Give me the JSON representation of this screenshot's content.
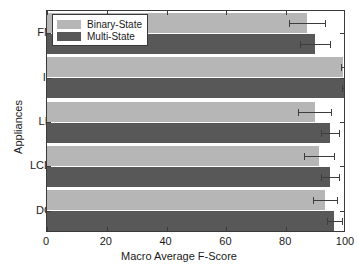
{
  "chart_data": {
    "type": "bar",
    "orientation": "horizontal",
    "title": "",
    "xlabel": "Macro Average F-Score",
    "ylabel": "Appliances",
    "categories": [
      "FN",
      "IL",
      "LP",
      "LCD",
      "DC"
    ],
    "xlim": [
      0,
      100
    ],
    "xticks": [
      0,
      20,
      40,
      60,
      80,
      100
    ],
    "xtick_labels": [
      "0",
      "20",
      "40",
      "60",
      "80",
      "100"
    ],
    "grid": false,
    "legend_position": "upper left",
    "series": [
      {
        "name": "Binary-State",
        "color": "#b6b6b6",
        "values": [
          87.0,
          99.0,
          89.5,
          91.0,
          93.0
        ],
        "errors": [
          6.0,
          0.6,
          5.5,
          5.0,
          4.0
        ]
      },
      {
        "name": "Multi-State",
        "color": "#585858",
        "values": [
          89.5,
          99.2,
          94.5,
          94.5,
          96.0
        ],
        "errors": [
          5.0,
          0.5,
          3.0,
          3.0,
          2.5
        ]
      }
    ]
  },
  "colors": {
    "binary_state": "#b6b6b6",
    "multi_state": "#585858",
    "axis": "#3a3a3a",
    "text": "#1a1a1a",
    "background": "#ffffff"
  }
}
